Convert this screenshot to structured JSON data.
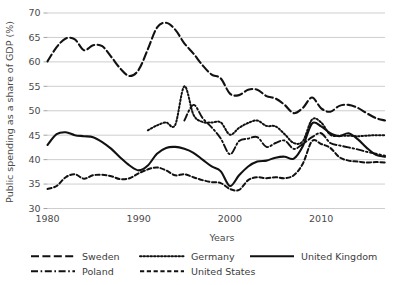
{
  "chart_data": {
    "type": "line",
    "title": "",
    "xlabel": "Years",
    "ylabel": "Public spending as a share of GDP (%)",
    "xlim": [
      1980,
      2017
    ],
    "ylim": [
      30,
      70
    ],
    "grid": true,
    "legend_position": "bottom",
    "xticks": [
      1980,
      1990,
      2000,
      2010
    ],
    "yticks": [
      30,
      35,
      40,
      45,
      50,
      55,
      60,
      65,
      70
    ],
    "series": [
      {
        "name": "Sweden",
        "dash": "long-dash",
        "x": [
          1980,
          1981,
          1982,
          1983,
          1984,
          1985,
          1986,
          1987,
          1988,
          1989,
          1990,
          1991,
          1992,
          1993,
          1994,
          1995,
          1996,
          1997,
          1998,
          1999,
          2000,
          2001,
          2002,
          2003,
          2004,
          2005,
          2006,
          2007,
          2008,
          2009,
          2010,
          2011,
          2012,
          2013,
          2014,
          2015,
          2016,
          2017
        ],
        "values": [
          60.1,
          63.0,
          64.8,
          64.6,
          62.4,
          63.4,
          63.2,
          61.0,
          58.6,
          57.1,
          58.4,
          62.6,
          67.0,
          68.0,
          66.6,
          63.8,
          61.7,
          59.3,
          57.4,
          56.6,
          53.5,
          53.2,
          54.3,
          54.3,
          53.0,
          52.5,
          51.2,
          49.5,
          50.6,
          52.7,
          50.5,
          49.8,
          51.0,
          51.2,
          50.6,
          49.5,
          48.5,
          48.0
        ]
      },
      {
        "name": "Poland",
        "dash": "dash-dot",
        "x": [
          1995,
          1996,
          1997,
          1998,
          1999,
          2000,
          2001,
          2002,
          2003,
          2004,
          2005,
          2006,
          2007,
          2008,
          2009,
          2010,
          2011,
          2012,
          2013,
          2014,
          2015,
          2016,
          2017
        ],
        "values": [
          48.0,
          51.2,
          48.5,
          46.6,
          44.3,
          41.1,
          43.8,
          44.3,
          44.6,
          42.6,
          43.4,
          43.9,
          42.2,
          43.2,
          44.6,
          45.4,
          43.4,
          42.9,
          42.5,
          42.1,
          41.6,
          41.2,
          40.8
        ]
      },
      {
        "name": "Germany",
        "dash": "dotted",
        "x": [
          1991,
          1992,
          1993,
          1994,
          1995,
          1996,
          1997,
          1998,
          1999,
          2000,
          2001,
          2002,
          2003,
          2004,
          2005,
          2006,
          2007,
          2008,
          2009,
          2010,
          2011,
          2012,
          2013,
          2014,
          2015,
          2016,
          2017
        ],
        "values": [
          46.0,
          47.0,
          47.6,
          47.1,
          55.0,
          49.2,
          47.7,
          47.6,
          47.6,
          45.1,
          46.5,
          47.5,
          48.0,
          46.9,
          46.8,
          45.2,
          43.4,
          43.8,
          48.2,
          47.6,
          45.1,
          44.9,
          44.9,
          44.8,
          44.9,
          45.0,
          45.0
        ]
      },
      {
        "name": "United States",
        "dash": "dashed",
        "x": [
          1980,
          1981,
          1982,
          1983,
          1984,
          1985,
          1986,
          1987,
          1988,
          1989,
          1990,
          1991,
          1992,
          1993,
          1994,
          1995,
          1996,
          1997,
          1998,
          1999,
          2000,
          2001,
          2002,
          2003,
          2004,
          2005,
          2006,
          2007,
          2008,
          2009,
          2010,
          2011,
          2012,
          2013,
          2014,
          2015,
          2016,
          2017
        ],
        "values": [
          34.0,
          34.6,
          36.4,
          37.0,
          36.1,
          36.8,
          36.9,
          36.6,
          36.0,
          36.2,
          37.2,
          38.0,
          38.4,
          37.8,
          36.8,
          37.0,
          36.4,
          35.8,
          35.4,
          35.2,
          34.0,
          33.8,
          35.8,
          36.4,
          36.2,
          36.4,
          36.2,
          36.8,
          39.2,
          43.8,
          43.2,
          42.4,
          40.5,
          39.8,
          39.6,
          39.4,
          39.5,
          39.4
        ]
      },
      {
        "name": "United Kingdom",
        "dash": "solid",
        "x": [
          1980,
          1981,
          1982,
          1983,
          1984,
          1985,
          1986,
          1987,
          1988,
          1989,
          1990,
          1991,
          1992,
          1993,
          1994,
          1995,
          1996,
          1997,
          1998,
          1999,
          2000,
          2001,
          2002,
          2003,
          2004,
          2005,
          2006,
          2007,
          2008,
          2009,
          2010,
          2011,
          2012,
          2013,
          2014,
          2015,
          2016,
          2017
        ],
        "values": [
          43.0,
          45.2,
          45.6,
          45.0,
          44.8,
          44.6,
          43.6,
          42.2,
          40.4,
          38.8,
          37.8,
          38.8,
          41.2,
          42.4,
          42.6,
          42.2,
          41.4,
          40.0,
          38.6,
          37.6,
          34.6,
          36.8,
          38.6,
          39.6,
          39.8,
          40.4,
          40.6,
          40.2,
          42.8,
          47.4,
          46.8,
          45.4,
          44.8,
          45.4,
          44.2,
          42.4,
          41.0,
          40.6
        ]
      }
    ]
  },
  "axis": {
    "ylabel": "Public spending as a share of GDP (%)",
    "xlabel": "Years",
    "xticks": [
      "1980",
      "1990",
      "2000",
      "2010"
    ],
    "yticks": [
      "70",
      "65",
      "60",
      "55",
      "50",
      "45",
      "40",
      "35",
      "30"
    ]
  },
  "legend": {
    "items": [
      {
        "label": "Sweden",
        "style": "long-dash"
      },
      {
        "label": "Germany",
        "style": "dotted"
      },
      {
        "label": "United Kingdom",
        "style": "solid"
      },
      {
        "label": "Poland",
        "style": "dash-dot"
      },
      {
        "label": "United States",
        "style": "dashed"
      }
    ]
  },
  "colors": {
    "line": "#111111",
    "grid": "#b9b9b9",
    "text": "#3c3c3c"
  }
}
